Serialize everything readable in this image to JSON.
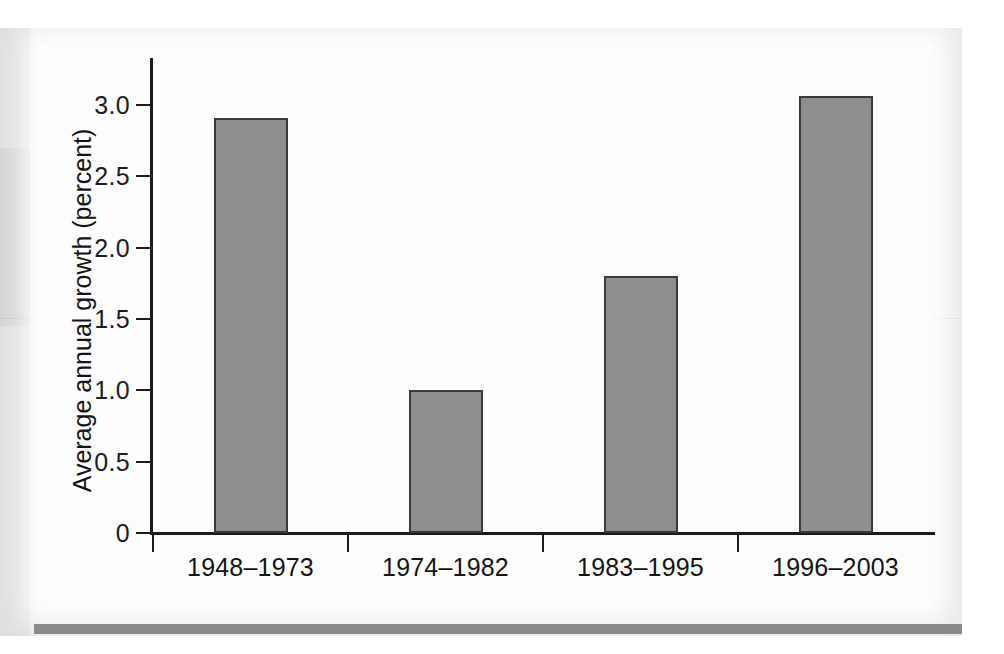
{
  "chart_data": {
    "type": "bar",
    "title": "",
    "xlabel": "",
    "ylabel": "Average annual growth (percent)",
    "categories": [
      "1948–1973",
      "1974–1982",
      "1983–1995",
      "1996–2003"
    ],
    "values": [
      2.91,
      1.0,
      1.8,
      3.06
    ],
    "ylim": [
      0,
      3.35
    ],
    "ytick_values": [
      0,
      0.5,
      1.0,
      1.5,
      2.0,
      2.5,
      3.0
    ],
    "ytick_labels": [
      "0",
      "0.5",
      "1.0",
      "1.5",
      "2.0",
      "2.5",
      "3.0"
    ],
    "grid": false,
    "legend": null,
    "bar_color": "#8e8e8e",
    "bar_edge_color": "#3a3a3a",
    "axis_color": "#1b1b1b",
    "panel_color": "#fdfdfd",
    "page_color": "#e9e9e7",
    "rule_color": "#8a8a8a"
  }
}
